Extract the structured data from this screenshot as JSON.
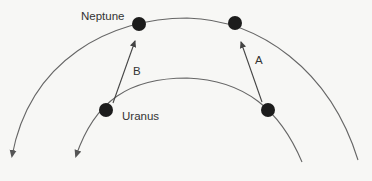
{
  "diagram": {
    "title": "",
    "labels": {
      "neptune": "Neptune",
      "uranus": "Uranus",
      "vector_a": "A",
      "vector_b": "B"
    },
    "orbits": [
      {
        "name": "neptune-orbit",
        "direction": "counterclockwise (arrow at left end)"
      },
      {
        "name": "uranus-orbit",
        "direction": "counterclockwise (arrow at left end)"
      }
    ],
    "planets": [
      {
        "name": "neptune-position-1",
        "body": "Neptune",
        "orbit": "outer"
      },
      {
        "name": "neptune-position-2",
        "body": "Neptune",
        "orbit": "outer"
      },
      {
        "name": "uranus-position-1",
        "body": "Uranus",
        "orbit": "inner"
      },
      {
        "name": "uranus-position-2",
        "body": "Uranus",
        "orbit": "inner"
      }
    ],
    "vectors": [
      {
        "label": "B",
        "from": "uranus-position-1",
        "to": "neptune-position-1"
      },
      {
        "label": "A",
        "from": "uranus-position-2",
        "to": "neptune-position-2"
      }
    ],
    "colors": {
      "planet": "#1c1c1c",
      "orbit": "#666666",
      "vector": "#444444",
      "background": "#f7f7f5"
    }
  }
}
